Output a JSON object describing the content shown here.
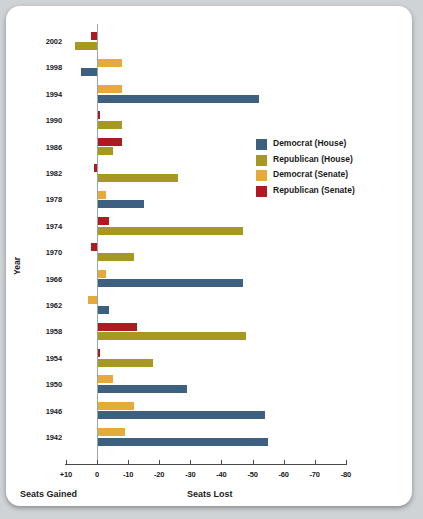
{
  "chart_data": {
    "type": "bar",
    "title": "",
    "orientation": "horizontal",
    "xlabel": "",
    "ylabel": "Year",
    "xlim": [
      10,
      -80
    ],
    "xticks": [
      "+10",
      "0",
      "-10",
      "-20",
      "-30",
      "-40",
      "-50",
      "-60",
      "-70",
      "-80"
    ],
    "left_caption": "Seats Gained",
    "right_caption": "Seats Lost",
    "categories": [
      "2002",
      "1998",
      "1994",
      "1990",
      "1986",
      "1982",
      "1978",
      "1974",
      "1970",
      "1966",
      "1962",
      "1958",
      "1954",
      "1950",
      "1946",
      "1942"
    ],
    "series": [
      {
        "name": "Democrat (House)",
        "color": "#3d6080",
        "values": [
          null,
          5,
          -52,
          null,
          null,
          null,
          -15,
          null,
          null,
          -47,
          -4,
          null,
          null,
          -29,
          -54,
          -55
        ]
      },
      {
        "name": "Republican (House)",
        "color": "#a79821",
        "values": [
          7,
          null,
          null,
          -8,
          -5,
          -26,
          null,
          -47,
          -12,
          null,
          null,
          -48,
          -18,
          null,
          null,
          null
        ]
      },
      {
        "name": "Democrat (Senate)",
        "color": "#e8a93b",
        "values": [
          null,
          -8,
          -8,
          null,
          null,
          null,
          -3,
          null,
          null,
          -3,
          3,
          null,
          null,
          -5,
          -12,
          -9
        ]
      },
      {
        "name": "Republican (Senate)",
        "color": "#ad1a21",
        "values": [
          2,
          null,
          null,
          -1,
          -8,
          1,
          null,
          -4,
          2,
          null,
          null,
          -13,
          -1,
          null,
          null,
          null
        ]
      }
    ],
    "legend_position": "right-upper",
    "grid": false,
    "colors": {
      "democrat_house": "#3d6080",
      "republican_house": "#a79821",
      "democrat_senate": "#e8a93b",
      "republican_senate": "#ad1a21",
      "axis": "#4a4a4a",
      "zero_line": "#9aa6ad",
      "card": "#ffffff",
      "page_background": "#cfd3d6"
    }
  }
}
